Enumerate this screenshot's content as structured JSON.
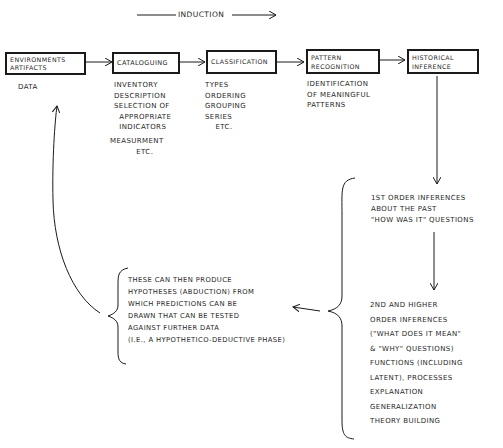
{
  "header": {
    "induction_label": "INDUCTION"
  },
  "boxes": [
    {
      "id": "environments-artifacts",
      "lines": "ENVIRONMENTS\nARTIFACTS"
    },
    {
      "id": "cataloguing",
      "lines": "CATALOGUING"
    },
    {
      "id": "classification",
      "lines": "CLASSIFICATION"
    },
    {
      "id": "pattern-recognition",
      "lines": "PATTERN\nRECOGNITION"
    },
    {
      "id": "historical-inference",
      "lines": "HISTORICAL\nINFERENCE"
    }
  ],
  "captions": {
    "data": "DATA",
    "cataloguing": "INVENTORY\nDESCRIPTION\nSELECTION OF\n  APPROPRIATE\n  INDICATORS",
    "cataloguing_measurement": "MEASURMENT\n          ETC.",
    "classification": "TYPES\nORDERING\nGROUPING\nSERIES\n    ETC.",
    "pattern_recognition": "IDENTIFICATION\nOF MEANINGFUL\nPATTERNS"
  },
  "inferences": {
    "first_order": "1ST ORDER INFERENCES\nABOUT THE PAST\n\"HOW WAS IT\" QUESTIONS",
    "second_order": "2ND AND HIGHER\nORDER INFERENCES\n(\"WHAT DOES IT MEAN\"\n& \"WHY\" QUESTIONS)\nFUNCTIONS (INCLUDING\nLATENT), PROCESSES\nEXPLANATION\nGENERALIZATION\nTHEORY BUILDING"
  },
  "hypotheses": {
    "text": "THESE CAN THEN PRODUCE\nHYPOTHESES (ABDUCTION) FROM\nWHICH PREDICTIONS CAN BE\nDRAWN THAT CAN BE TESTED\nAGAINST FURTHER DATA\n(I.E., A HYPOTHETICO-DEDUCTIVE PHASE)"
  },
  "colors": {
    "ink": "#1a1a1a",
    "paper": "#ffffff"
  }
}
